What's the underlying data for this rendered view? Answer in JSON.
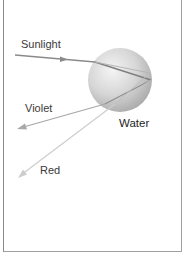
{
  "diagram": {
    "labels": {
      "sunlight": "Sunlight",
      "violet": "Violet",
      "water": "Water",
      "red": "Red"
    },
    "colors": {
      "sunlight_ray": "#8a8a8a",
      "violet_ray": "#a8a8a8",
      "red_ray": "#cccccc",
      "droplet_light": "#eeeeee",
      "droplet_dark": "#a9a9a9",
      "frame": "#8a8a8a",
      "text": "#3a3a3a"
    },
    "droplet": {
      "cx": 120,
      "cy": 80,
      "r": 32
    }
  }
}
